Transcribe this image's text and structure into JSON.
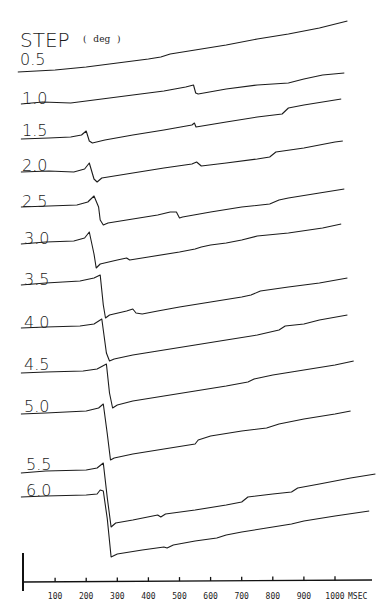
{
  "chart_data": {
    "type": "line",
    "title": "STEP",
    "title_unit": "( deg )",
    "xlabel": "MSEC",
    "ylabel": "",
    "xlim": [
      0,
      1120
    ],
    "x_ticks": [
      100,
      200,
      300,
      400,
      500,
      600,
      700,
      800,
      900,
      1000
    ],
    "x_tick_labels": [
      "100",
      "200",
      "300",
      "400",
      "500",
      "600",
      "700",
      "800",
      "900",
      "1000"
    ],
    "grid": false,
    "legend": "none",
    "y_units": "relative position (a.u., upward positive), traces vertically offset",
    "series": [
      {
        "name": "0.5",
        "label": "0.5",
        "points": [
          [
            -20,
            0
          ],
          [
            100,
            2
          ],
          [
            200,
            5
          ],
          [
            300,
            9
          ],
          [
            400,
            13
          ],
          [
            440,
            15
          ],
          [
            470,
            18
          ],
          [
            550,
            22
          ],
          [
            650,
            27
          ],
          [
            750,
            33
          ],
          [
            850,
            38
          ],
          [
            950,
            44
          ],
          [
            1040,
            51
          ]
        ]
      },
      {
        "name": "1.0",
        "label": "1.0",
        "points": [
          [
            -10,
            0
          ],
          [
            60,
            2
          ],
          [
            150,
            1
          ],
          [
            250,
            5
          ],
          [
            350,
            9
          ],
          [
            450,
            13
          ],
          [
            520,
            17
          ],
          [
            545,
            19
          ],
          [
            552,
            11
          ],
          [
            560,
            10
          ],
          [
            650,
            15
          ],
          [
            750,
            19
          ],
          [
            850,
            21
          ],
          [
            900,
            25
          ],
          [
            960,
            29
          ],
          [
            1030,
            31
          ]
        ]
      },
      {
        "name": "1.5",
        "label": "1.5",
        "points": [
          [
            -10,
            0
          ],
          [
            80,
            1
          ],
          [
            150,
            2
          ],
          [
            185,
            4
          ],
          [
            200,
            8
          ],
          [
            210,
            -2
          ],
          [
            220,
            -4
          ],
          [
            260,
            -1
          ],
          [
            350,
            4
          ],
          [
            450,
            9
          ],
          [
            540,
            14
          ],
          [
            548,
            16
          ],
          [
            553,
            12
          ],
          [
            650,
            17
          ],
          [
            750,
            22
          ],
          [
            830,
            25
          ],
          [
            850,
            31
          ],
          [
            900,
            34
          ],
          [
            1020,
            40
          ]
        ]
      },
      {
        "name": "2.0",
        "label": "2.0",
        "points": [
          [
            -10,
            0
          ],
          [
            80,
            1
          ],
          [
            160,
            0
          ],
          [
            195,
            3
          ],
          [
            210,
            9
          ],
          [
            225,
            -7
          ],
          [
            235,
            -10
          ],
          [
            250,
            -6
          ],
          [
            350,
            -1
          ],
          [
            450,
            4
          ],
          [
            540,
            8
          ],
          [
            555,
            10
          ],
          [
            570,
            6
          ],
          [
            650,
            9
          ],
          [
            750,
            13
          ],
          [
            790,
            15
          ],
          [
            810,
            20
          ],
          [
            900,
            24
          ],
          [
            1000,
            30
          ],
          [
            1025,
            31
          ]
        ]
      },
      {
        "name": "2.5",
        "label": "2.5",
        "points": [
          [
            -10,
            0
          ],
          [
            80,
            1
          ],
          [
            170,
            2
          ],
          [
            205,
            5
          ],
          [
            225,
            11
          ],
          [
            240,
            0
          ],
          [
            245,
            -13
          ],
          [
            255,
            -18
          ],
          [
            270,
            -16
          ],
          [
            350,
            -12
          ],
          [
            430,
            -8
          ],
          [
            470,
            -5
          ],
          [
            490,
            -5
          ],
          [
            500,
            -11
          ],
          [
            510,
            -10
          ],
          [
            600,
            -5
          ],
          [
            700,
            0
          ],
          [
            790,
            3
          ],
          [
            820,
            7
          ],
          [
            850,
            9
          ],
          [
            950,
            14
          ],
          [
            1030,
            18
          ]
        ]
      },
      {
        "name": "3.0",
        "label": "3.0",
        "points": [
          [
            -10,
            0
          ],
          [
            70,
            2
          ],
          [
            160,
            3
          ],
          [
            195,
            6
          ],
          [
            210,
            12
          ],
          [
            225,
            -10
          ],
          [
            232,
            -24
          ],
          [
            245,
            -20
          ],
          [
            300,
            -16
          ],
          [
            330,
            -14
          ],
          [
            340,
            -16
          ],
          [
            400,
            -13
          ],
          [
            500,
            -8
          ],
          [
            550,
            -5
          ],
          [
            570,
            -3
          ],
          [
            600,
            -1
          ],
          [
            650,
            1
          ],
          [
            700,
            4
          ],
          [
            750,
            8
          ],
          [
            850,
            11
          ],
          [
            960,
            16
          ],
          [
            1020,
            20
          ]
        ]
      },
      {
        "name": "3.5",
        "label": "3.5",
        "points": [
          [
            -10,
            0
          ],
          [
            70,
            2
          ],
          [
            180,
            4
          ],
          [
            225,
            7
          ],
          [
            245,
            10
          ],
          [
            255,
            -20
          ],
          [
            262,
            -33
          ],
          [
            275,
            -30
          ],
          [
            330,
            -26
          ],
          [
            350,
            -24
          ],
          [
            360,
            -28
          ],
          [
            380,
            -29
          ],
          [
            430,
            -26
          ],
          [
            500,
            -22
          ],
          [
            600,
            -17
          ],
          [
            700,
            -12
          ],
          [
            730,
            -10
          ],
          [
            760,
            -6
          ],
          [
            850,
            -2
          ],
          [
            950,
            2
          ],
          [
            1040,
            7
          ]
        ]
      },
      {
        "name": "4.0",
        "label": "4.0",
        "points": [
          [
            -10,
            0
          ],
          [
            70,
            1
          ],
          [
            180,
            2
          ],
          [
            225,
            4
          ],
          [
            250,
            9
          ],
          [
            265,
            -25
          ],
          [
            275,
            -33
          ],
          [
            290,
            -31
          ],
          [
            350,
            -27
          ],
          [
            450,
            -22
          ],
          [
            550,
            -17
          ],
          [
            650,
            -12
          ],
          [
            750,
            -7
          ],
          [
            820,
            -2
          ],
          [
            840,
            2
          ],
          [
            900,
            4
          ],
          [
            950,
            8
          ],
          [
            1040,
            13
          ]
        ]
      },
      {
        "name": "4.5",
        "label": "4.5",
        "points": [
          [
            -10,
            0
          ],
          [
            70,
            1
          ],
          [
            190,
            2
          ],
          [
            235,
            4
          ],
          [
            265,
            9
          ],
          [
            275,
            -20
          ],
          [
            285,
            -35
          ],
          [
            300,
            -32
          ],
          [
            350,
            -28
          ],
          [
            450,
            -23
          ],
          [
            550,
            -18
          ],
          [
            650,
            -13
          ],
          [
            720,
            -9
          ],
          [
            740,
            -6
          ],
          [
            800,
            -2
          ],
          [
            900,
            3
          ],
          [
            1000,
            8
          ],
          [
            1060,
            12
          ]
        ]
      },
      {
        "name": "5.0",
        "label": "5.0",
        "points": [
          [
            -10,
            0
          ],
          [
            70,
            1
          ],
          [
            200,
            3
          ],
          [
            240,
            6
          ],
          [
            255,
            10
          ],
          [
            268,
            -20
          ],
          [
            278,
            -46
          ],
          [
            290,
            -44
          ],
          [
            350,
            -40
          ],
          [
            450,
            -35
          ],
          [
            550,
            -30
          ],
          [
            560,
            -26
          ],
          [
            600,
            -22
          ],
          [
            700,
            -17
          ],
          [
            780,
            -14
          ],
          [
            800,
            -12
          ],
          [
            820,
            -10
          ],
          [
            900,
            -5
          ],
          [
            1000,
            0
          ],
          [
            1050,
            3
          ]
        ]
      },
      {
        "name": "5.5",
        "label": "5.5",
        "points": [
          [
            -10,
            0
          ],
          [
            70,
            2
          ],
          [
            200,
            3
          ],
          [
            235,
            5
          ],
          [
            255,
            10
          ],
          [
            268,
            -25
          ],
          [
            280,
            -54
          ],
          [
            295,
            -50
          ],
          [
            350,
            -47
          ],
          [
            430,
            -42
          ],
          [
            440,
            -44
          ],
          [
            455,
            -41
          ],
          [
            550,
            -37
          ],
          [
            650,
            -32
          ],
          [
            700,
            -29
          ],
          [
            720,
            -24
          ],
          [
            800,
            -21
          ],
          [
            860,
            -19
          ],
          [
            880,
            -15
          ],
          [
            950,
            -11
          ],
          [
            1050,
            -5
          ],
          [
            1130,
            -1
          ]
        ]
      },
      {
        "name": "6.0",
        "label": "6.0",
        "points": [
          [
            -10,
            0
          ],
          [
            70,
            1
          ],
          [
            200,
            2
          ],
          [
            235,
            3
          ],
          [
            245,
            7
          ],
          [
            255,
            6
          ],
          [
            268,
            -22
          ],
          [
            280,
            -60
          ],
          [
            300,
            -57
          ],
          [
            380,
            -53
          ],
          [
            450,
            -50
          ],
          [
            460,
            -51
          ],
          [
            480,
            -48
          ],
          [
            550,
            -44
          ],
          [
            620,
            -41
          ],
          [
            650,
            -38
          ],
          [
            700,
            -35
          ],
          [
            800,
            -30
          ],
          [
            860,
            -27
          ],
          [
            900,
            -24
          ],
          [
            1000,
            -19
          ],
          [
            1110,
            -14
          ]
        ]
      }
    ]
  }
}
